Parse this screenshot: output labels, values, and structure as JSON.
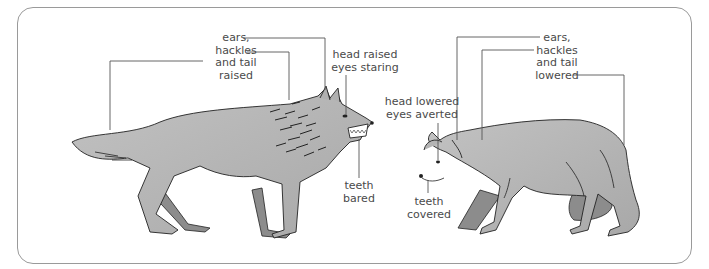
{
  "diagram": {
    "colors": {
      "frame": "#9a9a9a",
      "body_fill": "#b4b4b4",
      "dark_leg": "#8c8c8c",
      "outline": "#222222",
      "leader": "#555555",
      "text": "#4a4a4a"
    },
    "dominant_wolf": {
      "labels": {
        "ears_hackles_tail": [
          "ears,",
          "hackles",
          "and tail",
          "raised"
        ],
        "head_eyes": [
          "head raised",
          "eyes staring"
        ],
        "teeth": [
          "teeth",
          "bared"
        ]
      }
    },
    "submissive_wolf": {
      "labels": {
        "head_eyes": [
          "head lowered",
          "eyes averted"
        ],
        "teeth": [
          "teeth",
          "covered"
        ],
        "ears_hackles_tail": [
          "ears,",
          "hackles",
          "and tail",
          "lowered"
        ]
      }
    }
  }
}
